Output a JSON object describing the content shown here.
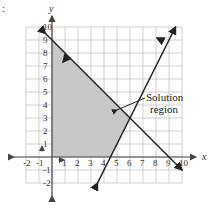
{
  "marker": ":",
  "graph": {
    "x_axis_label": "x",
    "y_axis_label": "y",
    "x_range": [
      -2,
      10
    ],
    "y_range": [
      -2,
      10
    ],
    "x_ticks": [
      "-2",
      "-1",
      "1",
      "2",
      "3",
      "4",
      "5",
      "6",
      "7",
      "8",
      "9",
      "10"
    ],
    "y_ticks": [
      "-2",
      "-1",
      "1",
      "2",
      "3",
      "4",
      "5",
      "6",
      "7",
      "8",
      "9",
      "10"
    ],
    "annotation": {
      "line1": "Solution",
      "line2": "region"
    },
    "colors": {
      "shade": "#c8c8c8",
      "grid": "#bdbdbd",
      "line": "#222222",
      "axis": "#555555"
    }
  },
  "chart_data": {
    "type": "line",
    "title": "",
    "xlabel": "x",
    "ylabel": "y",
    "xlim": [
      -2,
      10
    ],
    "ylim": [
      -2,
      10
    ],
    "grid": true,
    "series": [
      {
        "name": "x + y = 9",
        "points": [
          [
            -0.5,
            9.5
          ],
          [
            9.5,
            -0.5
          ]
        ],
        "shade_side": "below-left"
      },
      {
        "name": "y = 2x - 9",
        "points": [
          [
            3.5,
            -2
          ],
          [
            9.5,
            10
          ]
        ],
        "shade_side": "left"
      }
    ],
    "shaded_region": {
      "label": "Solution region",
      "vertices": [
        [
          0,
          0
        ],
        [
          4.5,
          0
        ],
        [
          6,
          3
        ],
        [
          0,
          9
        ]
      ]
    },
    "annotations": [
      "Solution region"
    ]
  }
}
